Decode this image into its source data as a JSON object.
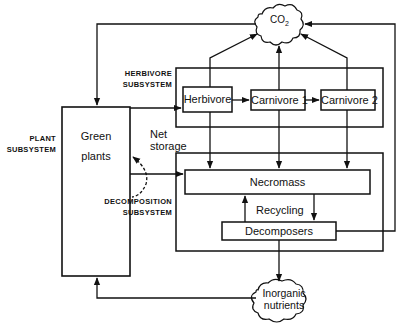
{
  "diagram": {
    "type": "ecosystem-flow",
    "subsystems": {
      "plant": {
        "line1": "PLANT",
        "line2": "SUBSYSTEM"
      },
      "herbivore": {
        "line1": "HERBIVORE",
        "line2": "SUBSYSTEM"
      },
      "decomposition": {
        "line1": "DECOMPOSITION",
        "line2": "SUBSYSTEM"
      }
    },
    "nodes": {
      "green_plants": {
        "line1": "Green",
        "line2": "plants"
      },
      "herbivore": "Herbivore",
      "carnivore1": "Carnivore 1",
      "carnivore2": "Carnivore 2",
      "necromass": "Necromass",
      "decomposers": "Decomposers",
      "co2": {
        "main": "CO",
        "sub": "2"
      },
      "inorganic": {
        "line1": "Inorganic",
        "line2": "nutrients"
      }
    },
    "edge_labels": {
      "net_storage": {
        "line1": "Net",
        "line2": "storage"
      },
      "recycling": "Recycling"
    },
    "edges": [
      {
        "from": "CO2",
        "to": "Green plants"
      },
      {
        "from": "Green plants",
        "to": "Herbivore"
      },
      {
        "from": "Green plants",
        "to": "Necromass"
      },
      {
        "from": "Green plants",
        "to": "Green plants",
        "label": "Net storage"
      },
      {
        "from": "Herbivore",
        "to": "Carnivore 1"
      },
      {
        "from": "Carnivore 1",
        "to": "Carnivore 2"
      },
      {
        "from": "Herbivore",
        "to": "CO2"
      },
      {
        "from": "Carnivore 1",
        "to": "CO2"
      },
      {
        "from": "Carnivore 2",
        "to": "CO2"
      },
      {
        "from": "Herbivore",
        "to": "Necromass"
      },
      {
        "from": "Carnivore 1",
        "to": "Necromass"
      },
      {
        "from": "Carnivore 2",
        "to": "Necromass"
      },
      {
        "from": "Necromass",
        "to": "Decomposers"
      },
      {
        "from": "Decomposers",
        "to": "Necromass",
        "label": "Recycling"
      },
      {
        "from": "Decomposers",
        "to": "CO2"
      },
      {
        "from": "Decomposers",
        "to": "Inorganic nutrients"
      },
      {
        "from": "Inorganic nutrients",
        "to": "Green plants"
      }
    ]
  }
}
